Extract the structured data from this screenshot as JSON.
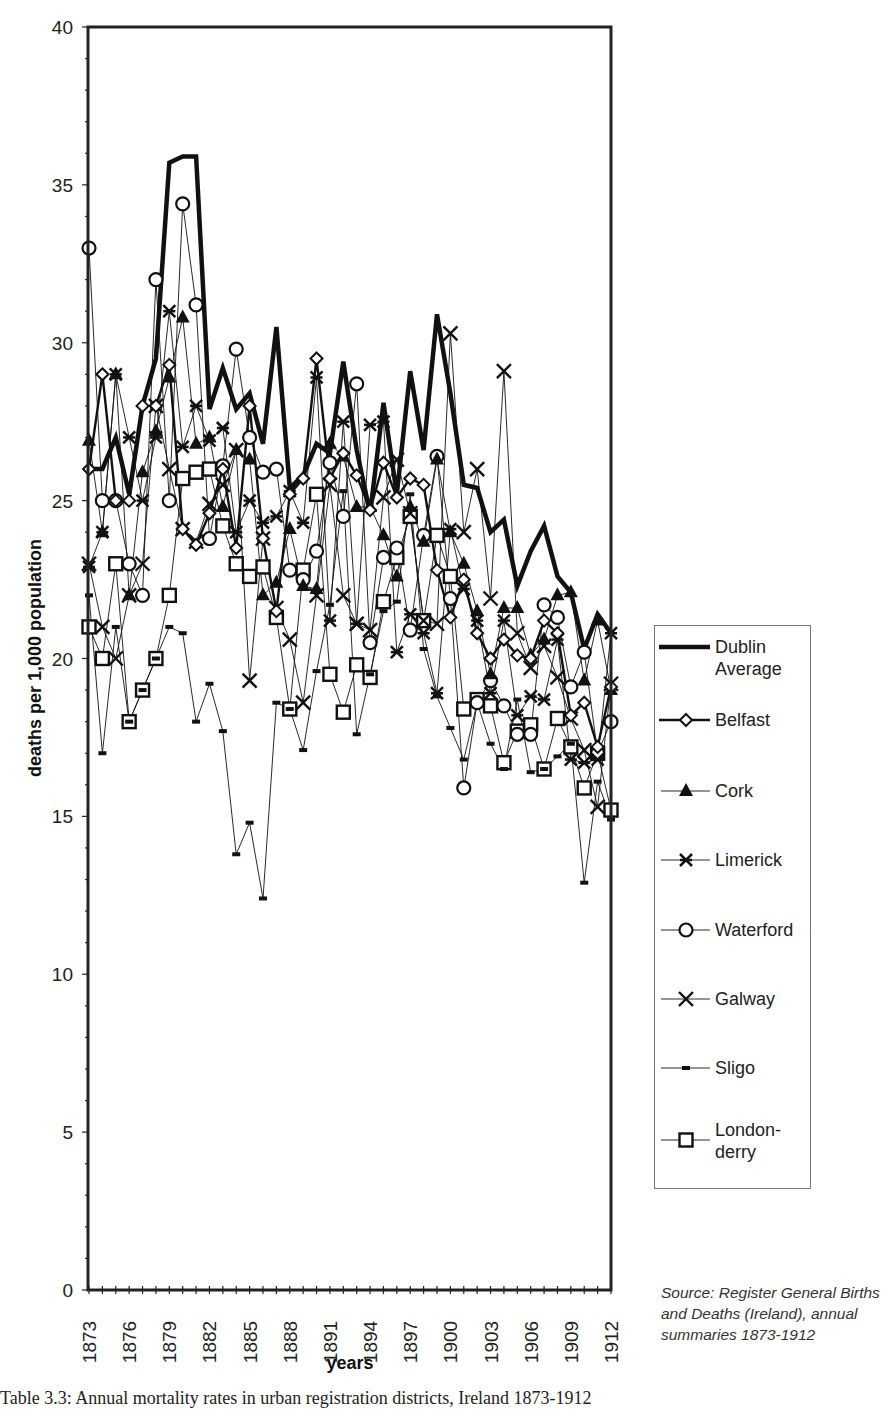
{
  "chart_data": {
    "type": "line",
    "title": "",
    "xlabel": "years",
    "ylabel": "deaths per 1,000 population",
    "ylim": [
      0,
      40
    ],
    "yticks": [
      0,
      5,
      10,
      15,
      20,
      25,
      30,
      35,
      40
    ],
    "xtick_labels": [
      "1873",
      "1876",
      "1879",
      "1882",
      "1885",
      "1888",
      "1891",
      "1894",
      "1897",
      "1900",
      "1903",
      "1906",
      "1909",
      "1912"
    ],
    "grid": false,
    "legend_position": "right",
    "x": [
      1873,
      1874,
      1875,
      1876,
      1877,
      1878,
      1879,
      1880,
      1881,
      1882,
      1883,
      1884,
      1885,
      1886,
      1887,
      1888,
      1889,
      1890,
      1891,
      1892,
      1893,
      1894,
      1895,
      1896,
      1897,
      1898,
      1899,
      1900,
      1901,
      1902,
      1903,
      1904,
      1905,
      1906,
      1907,
      1908,
      1909,
      1910,
      1911,
      1912
    ],
    "series": [
      {
        "name": "Dublin Average",
        "marker": "none",
        "style": "thick",
        "values": [
          26.0,
          26.0,
          27.0,
          25.2,
          28.0,
          29.5,
          35.7,
          35.9,
          35.9,
          27.9,
          29.2,
          27.9,
          28.4,
          26.8,
          30.5,
          25.4,
          25.8,
          26.8,
          26.5,
          29.4,
          26.6,
          24.6,
          28.1,
          25.2,
          29.1,
          26.6,
          30.9,
          28.4,
          25.5,
          25.4,
          24.0,
          24.4,
          22.3,
          23.4,
          24.2,
          22.6,
          22.1,
          20.3,
          21.4,
          20.8
        ]
      },
      {
        "name": "Belfast",
        "marker": "diamond",
        "style": "medium",
        "values": [
          26.0,
          29.0,
          25.0,
          25.0,
          28.0,
          28.0,
          29.3,
          24.1,
          23.6,
          24.6,
          26.0,
          23.5,
          28.0,
          23.8,
          21.5,
          25.2,
          25.7,
          29.5,
          25.7,
          26.5,
          25.8,
          24.7,
          26.2,
          25.1,
          25.7,
          25.5,
          22.8,
          21.3,
          22.5,
          20.8,
          20.0,
          20.6,
          20.1,
          20.0,
          21.2,
          20.8,
          18.2,
          18.6,
          17.2,
          19.1
        ]
      },
      {
        "name": "Cork",
        "marker": "triangle",
        "style": "thin",
        "values": [
          26.9,
          24.0,
          29.0,
          22.0,
          25.9,
          27.2,
          28.9,
          30.8,
          26.8,
          27.0,
          24.8,
          26.6,
          26.3,
          22.0,
          22.4,
          24.1,
          22.3,
          22.2,
          26.8,
          26.4,
          24.8,
          24.8,
          23.9,
          22.6,
          24.8,
          23.7,
          26.3,
          24.0,
          23.0,
          21.5,
          19.5,
          21.6,
          21.6,
          20.1,
          20.6,
          22.0,
          22.1,
          19.3,
          21.2,
          19.0
        ]
      },
      {
        "name": "Limerick",
        "marker": "asterisk",
        "style": "thin",
        "values": [
          22.9,
          24.0,
          29.0,
          27.0,
          25.0,
          27.0,
          31.0,
          26.7,
          28.0,
          26.9,
          27.3,
          24.0,
          25.0,
          24.3,
          24.5,
          25.3,
          24.3,
          28.9,
          21.2,
          27.5,
          21.1,
          27.4,
          27.5,
          20.2,
          21.4,
          20.8,
          18.9,
          24.1,
          22.2,
          21.2,
          18.9,
          21.2,
          18.2,
          18.8,
          18.7,
          20.6,
          16.8,
          16.7,
          16.8,
          20.8
        ]
      },
      {
        "name": "Waterford",
        "marker": "circle",
        "style": "thin",
        "values": [
          33.0,
          25.0,
          25.0,
          23.0,
          22.0,
          32.0,
          25.0,
          34.4,
          31.2,
          23.8,
          26.1,
          29.8,
          27.0,
          25.9,
          26.0,
          22.8,
          22.5,
          23.4,
          26.2,
          24.5,
          28.7,
          20.5,
          23.2,
          23.5,
          20.9,
          23.9,
          26.4,
          21.9,
          15.9,
          18.6,
          19.3,
          18.5,
          17.6,
          17.6,
          21.7,
          21.3,
          19.1,
          20.2,
          17.0,
          18.0
        ]
      },
      {
        "name": "Galway",
        "marker": "x",
        "style": "thin",
        "values": [
          23.0,
          21.0,
          20.0,
          22.0,
          23.0,
          28.0,
          26.0,
          24.1,
          23.7,
          24.9,
          25.5,
          26.6,
          19.3,
          23.8,
          21.6,
          20.6,
          18.6,
          22.0,
          25.5,
          22.0,
          21.1,
          20.9,
          25.1,
          26.3,
          24.6,
          21.2,
          21.1,
          30.3,
          24.0,
          26.0,
          21.9,
          29.1,
          20.8,
          19.7,
          20.4,
          19.4,
          18.1,
          17.1,
          15.3,
          19.2
        ]
      },
      {
        "name": "Sligo",
        "marker": "dash",
        "style": "thin",
        "values": [
          22.0,
          17.0,
          21.0,
          18.0,
          19.0,
          20.0,
          21.0,
          20.8,
          18.0,
          19.2,
          17.7,
          13.8,
          14.8,
          12.4,
          18.6,
          18.4,
          17.1,
          19.6,
          21.7,
          25.3,
          17.6,
          19.5,
          21.5,
          21.8,
          25.2,
          20.3,
          18.8,
          17.8,
          16.8,
          18.6,
          17.3,
          16.5,
          18.7,
          16.4,
          16.5,
          16.9,
          17.3,
          12.9,
          16.1,
          14.9
        ]
      },
      {
        "name": "London-derry",
        "marker": "square",
        "style": "thin",
        "values": [
          21.0,
          20.0,
          23.0,
          18.0,
          19.0,
          20.0,
          22.0,
          25.7,
          25.9,
          26.0,
          24.2,
          23.0,
          22.6,
          22.9,
          21.3,
          18.4,
          22.8,
          25.2,
          19.5,
          18.3,
          19.8,
          19.4,
          21.8,
          23.2,
          24.5,
          21.2,
          23.9,
          22.6,
          18.4,
          18.7,
          18.5,
          16.7,
          17.7,
          17.9,
          16.5,
          18.1,
          17.2,
          15.9,
          17.0,
          15.2
        ]
      }
    ]
  },
  "legend": {
    "items": [
      {
        "label_lines": [
          "Dublin",
          "Average"
        ],
        "marker": "none"
      },
      {
        "label_lines": [
          "Belfast"
        ],
        "marker": "diamond"
      },
      {
        "label_lines": [
          "Cork"
        ],
        "marker": "triangle"
      },
      {
        "label_lines": [
          "Limerick"
        ],
        "marker": "asterisk"
      },
      {
        "label_lines": [
          "Waterford"
        ],
        "marker": "circle"
      },
      {
        "label_lines": [
          "Galway"
        ],
        "marker": "x"
      },
      {
        "label_lines": [
          "Sligo"
        ],
        "marker": "dash"
      },
      {
        "label_lines": [
          "London-",
          "derry"
        ],
        "marker": "square"
      }
    ]
  },
  "source_note": "Source: Register General Births and Deaths (Ireland), annual summaries 1873-1912",
  "caption": "Table 3.3: Annual mortality rates in urban registration districts, Ireland 1873-1912",
  "colors": {
    "ink": "#111111",
    "frame": "#222222",
    "legend_border": "#777777",
    "background": "#ffffff"
  }
}
